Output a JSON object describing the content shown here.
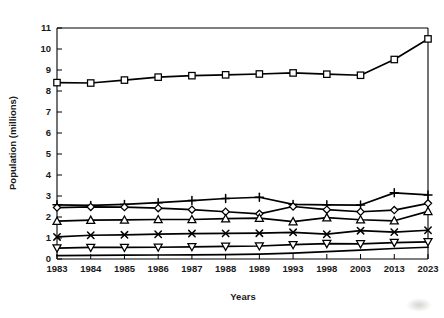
{
  "chart_data": {
    "type": "line",
    "title": "",
    "xlabel": "Years",
    "ylabel": "Population (millions)",
    "categories": [
      "1983",
      "1984",
      "1985",
      "1986",
      "1987",
      "1988",
      "1989",
      "1993",
      "1998",
      "2003",
      "2013",
      "2023"
    ],
    "x_tick_labels": [
      "1983",
      "1984",
      "1985",
      "1986",
      "1987",
      "1988",
      "1989",
      "1993",
      "1998",
      "2003",
      "2013",
      "2023"
    ],
    "y_tick_labels": [
      "0",
      "1",
      "2",
      "3",
      "4",
      "5",
      "6",
      "7",
      "8",
      "9",
      "10",
      "11"
    ],
    "y_tick_values": [
      0,
      1,
      2,
      3,
      4,
      5,
      6,
      7,
      8,
      9,
      10,
      11
    ],
    "ylim": [
      0,
      11
    ],
    "xlim": [
      0,
      11
    ],
    "grid": false,
    "legend": "none",
    "series": [
      {
        "name": "series-square",
        "marker": "square",
        "values": [
          8.4,
          8.38,
          8.52,
          8.66,
          8.73,
          8.77,
          8.81,
          8.86,
          8.8,
          8.75,
          9.5,
          10.48
        ]
      },
      {
        "name": "series-plus",
        "marker": "plus",
        "values": [
          2.58,
          2.55,
          2.6,
          2.68,
          2.78,
          2.88,
          2.94,
          2.6,
          2.58,
          2.57,
          3.15,
          3.05
        ]
      },
      {
        "name": "series-diamond",
        "marker": "diamond",
        "values": [
          2.45,
          2.48,
          2.47,
          2.42,
          2.35,
          2.25,
          2.15,
          2.5,
          2.35,
          2.25,
          2.33,
          2.65
        ]
      },
      {
        "name": "series-triangle-up",
        "marker": "triangle-up",
        "values": [
          1.8,
          1.85,
          1.86,
          1.88,
          1.88,
          1.92,
          1.95,
          1.78,
          1.97,
          1.87,
          1.82,
          2.27
        ]
      },
      {
        "name": "series-cross",
        "marker": "cross",
        "values": [
          1.05,
          1.13,
          1.15,
          1.18,
          1.21,
          1.22,
          1.23,
          1.27,
          1.18,
          1.35,
          1.28,
          1.37
        ]
      },
      {
        "name": "series-triangle-down",
        "marker": "triangle-down",
        "values": [
          0.52,
          0.55,
          0.55,
          0.56,
          0.58,
          0.6,
          0.62,
          0.68,
          0.73,
          0.72,
          0.78,
          0.82
        ]
      },
      {
        "name": "series-baseline",
        "marker": "none",
        "values": [
          0.16,
          0.17,
          0.18,
          0.19,
          0.2,
          0.21,
          0.23,
          0.28,
          0.35,
          0.42,
          0.5,
          0.56
        ]
      }
    ]
  }
}
